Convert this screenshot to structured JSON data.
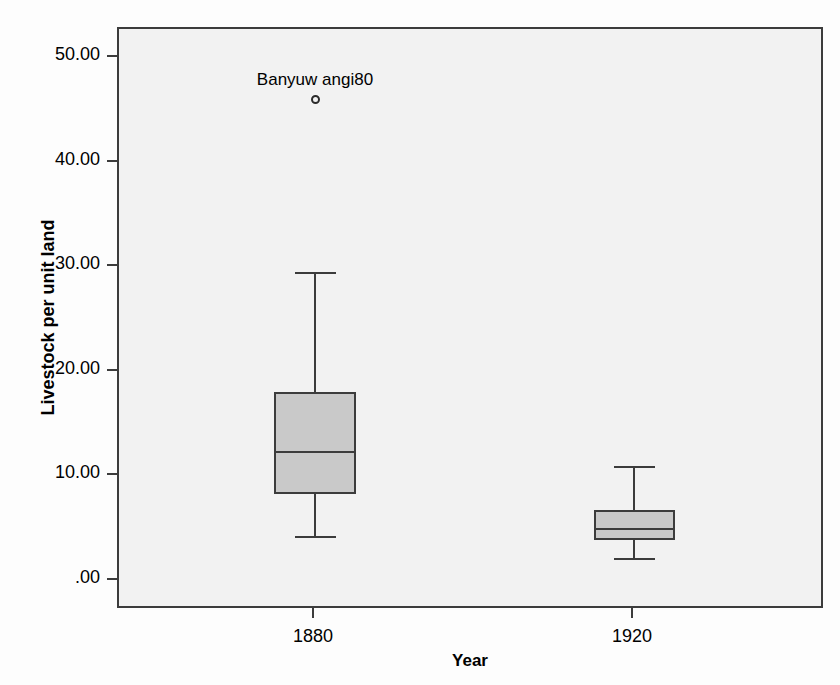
{
  "chart_data": {
    "type": "box",
    "title": "",
    "xlabel": "Year",
    "ylabel": "Livestock per unit land",
    "ylim": [
      -2.5,
      53.0
    ],
    "ytick_values": [
      50.0,
      40.0,
      30.0,
      20.0,
      10.0,
      0.0
    ],
    "ytick_labels": [
      "50.00",
      "40.00",
      "30.00",
      "20.00",
      "10.00",
      ".00"
    ],
    "categories": [
      "1880",
      "1920"
    ],
    "grid": false,
    "legend": "none",
    "boxes": [
      {
        "category": "1880",
        "whisker_low": 4.3,
        "q1": 8.3,
        "median": 12.4,
        "q3": 18.1,
        "whisker_high": 29.5,
        "outliers": [
          {
            "value": 46.0,
            "label": "Banyuw angi80"
          }
        ]
      },
      {
        "category": "1920",
        "whisker_low": 2.2,
        "q1": 3.9,
        "median": 5.1,
        "q3": 6.8,
        "whisker_high": 11.0,
        "outliers": []
      }
    ],
    "colors": {
      "box_fill": "#c9c9c9",
      "line": "#3c3c3c",
      "plot_background": "#f2f2f2",
      "page_background": "#fdfdfd",
      "text": "#000000"
    }
  }
}
